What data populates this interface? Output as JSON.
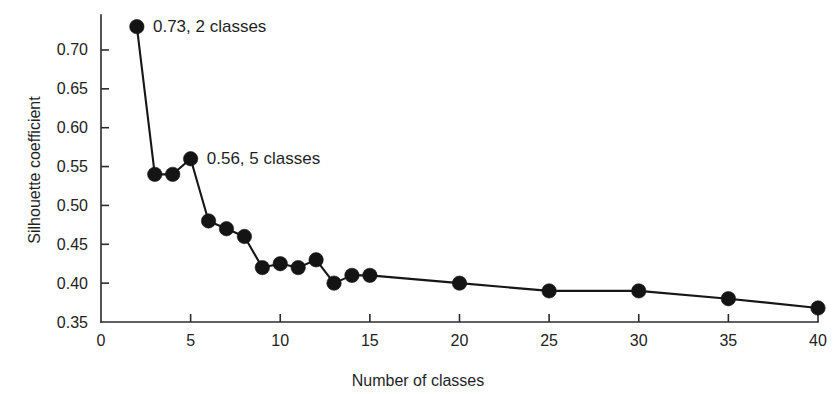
{
  "chart_data": {
    "type": "line",
    "title": "",
    "xlabel": "Number of classes",
    "ylabel": "Silhouette coefficient",
    "xlim": [
      0,
      40
    ],
    "ylim": [
      0.35,
      0.745
    ],
    "grid": false,
    "legend": "none",
    "xticks": [
      0,
      5,
      10,
      15,
      20,
      25,
      30,
      35,
      40
    ],
    "xtick_labels": [
      "0",
      "5",
      "10",
      "15",
      "20",
      "25",
      "30",
      "35",
      "40"
    ],
    "yticks": [
      0.35,
      0.4,
      0.45,
      0.5,
      0.55,
      0.6,
      0.65,
      0.7
    ],
    "ytick_labels": [
      "0.35",
      "0.40",
      "0.45",
      "0.50",
      "0.55",
      "0.60",
      "0.65",
      "0.70"
    ],
    "marker": "filled-circle",
    "marker_color": "#141414",
    "line_color": "#161616",
    "x": [
      2,
      3,
      4,
      5,
      6,
      7,
      8,
      9,
      10,
      11,
      12,
      13,
      14,
      15,
      20,
      25,
      30,
      35,
      40
    ],
    "y": [
      0.73,
      0.54,
      0.54,
      0.56,
      0.48,
      0.47,
      0.46,
      0.42,
      0.425,
      0.42,
      0.43,
      0.4,
      0.41,
      0.41,
      0.4,
      0.39,
      0.39,
      0.38,
      0.368
    ],
    "series": [
      {
        "name": "Silhouette coefficient",
        "values": [
          0.73,
          0.54,
          0.54,
          0.56,
          0.48,
          0.47,
          0.46,
          0.42,
          0.425,
          0.42,
          0.43,
          0.4,
          0.41,
          0.41,
          0.4,
          0.39,
          0.39,
          0.38,
          0.368
        ]
      }
    ],
    "annotations": [
      {
        "text": "0.73, 2 classes",
        "x": 2.9,
        "y": 0.731,
        "anchor": "start"
      },
      {
        "text": "0.56, 5 classes",
        "x": 5.9,
        "y": 0.561,
        "anchor": "start"
      }
    ]
  }
}
